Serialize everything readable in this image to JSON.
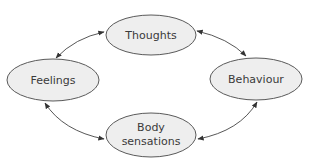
{
  "diagram": {
    "type": "cycle",
    "colors": {
      "node_fill": "#eeeeee",
      "node_stroke": "#5a5a5a",
      "text": "#3a3a3a",
      "arrow": "#444444"
    },
    "nodes": [
      {
        "id": "thoughts",
        "label": "Thoughts",
        "lines": [
          "Thoughts"
        ]
      },
      {
        "id": "feelings",
        "label": "Feelings",
        "lines": [
          "Feelings"
        ]
      },
      {
        "id": "behaviour",
        "label": "Behaviour",
        "lines": [
          "Behaviour"
        ]
      },
      {
        "id": "body-sensations",
        "label": "Body sensations",
        "lines": [
          "Body",
          "sensations"
        ]
      }
    ],
    "edges": [
      {
        "from": "thoughts",
        "to": "feelings",
        "direction": "bidirectional"
      },
      {
        "from": "thoughts",
        "to": "behaviour",
        "direction": "bidirectional"
      },
      {
        "from": "feelings",
        "to": "body-sensations",
        "direction": "bidirectional"
      },
      {
        "from": "behaviour",
        "to": "body-sensations",
        "direction": "bidirectional"
      }
    ]
  }
}
